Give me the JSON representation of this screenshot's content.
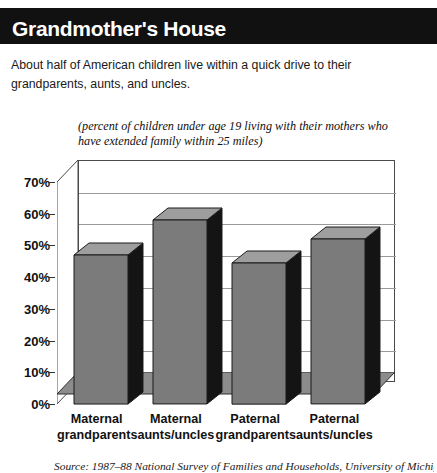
{
  "header": {
    "title": "Grandmother's House"
  },
  "deck": {
    "text": "About half of American children live within a quick drive to their grandparents, aunts, and uncles."
  },
  "source": {
    "text": "Source: 1987–88 National Survey of Families and Households, University of Michigan"
  },
  "colors": {
    "header_background": "#111111",
    "header_text": "#ffffff",
    "bar_front": "#7b7b7b",
    "bar_side": "#141414",
    "bar_top": "#9e9e9e",
    "gridline": "#9a9a9a",
    "axis": "#333333",
    "floor": "#8c8c8c",
    "page_background": "#ffffff"
  },
  "chart_data": {
    "type": "bar",
    "title": "Grandmother's House",
    "subtitle": "(percent of children under age 19 living with their mothers who have extended family within 25 miles)",
    "categories": [
      "Maternal grandparents",
      "Maternal aunts/uncles",
      "Paternal grandparents",
      "Paternal aunts/uncles"
    ],
    "category_lines": [
      [
        "Maternal",
        "grandparents"
      ],
      [
        "Maternal",
        "aunts/uncles"
      ],
      [
        "Paternal",
        "grandparents"
      ],
      [
        "Paternal",
        "aunts/uncles"
      ]
    ],
    "values": [
      47,
      58,
      44.5,
      52
    ],
    "xlabel": "",
    "ylabel": "",
    "ylim": [
      0,
      70
    ],
    "ytick_values": [
      0,
      10,
      20,
      30,
      40,
      50,
      60,
      70
    ],
    "ytick_labels": [
      "0%",
      "10%",
      "20%",
      "30%",
      "40%",
      "50%",
      "60%",
      "70%"
    ],
    "grid": true,
    "legend": "none",
    "style_3d": true
  }
}
